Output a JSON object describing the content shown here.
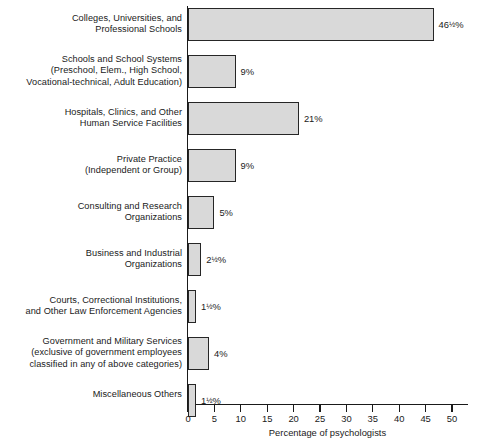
{
  "chart_data": {
    "type": "bar",
    "orientation": "horizontal",
    "title": "",
    "xlabel": "Percentage of psychologists",
    "ylabel": "",
    "xlim": [
      0,
      50
    ],
    "xticks": [
      0,
      5,
      10,
      15,
      20,
      25,
      30,
      35,
      40,
      45,
      50
    ],
    "xtick_labels": [
      "0",
      "5",
      "10",
      "15",
      "20",
      "25",
      "30",
      "35",
      "40",
      "45",
      "50"
    ],
    "grid": false,
    "legend": null,
    "bar_fill_color": "#d9d9d9",
    "bar_edge_color": "#262626",
    "categories": [
      "Colleges, Universities, and\nProfessional Schools",
      "Schools and School Systems\n(Preschool, Elem., High School,\nVocational-technical, Adult Education)",
      "Hospitals, Clinics, and Other\nHuman Service Facilities",
      "Private Practice\n(Independent or Group)",
      "Consulting and Research\nOrganizations",
      "Business and Industrial\nOrganizations",
      "Courts, Correctional Institutions,\nand Other Law Enforcement Agencies",
      "Government and Military Services\n(exclusive of government employees\nclassified in any of above categories)",
      "Miscellaneous Others"
    ],
    "values": [
      46.5,
      9,
      21,
      9,
      5,
      2.5,
      1.5,
      4,
      1.5
    ],
    "value_labels": [
      "46½%",
      "9%",
      "21%",
      "9%",
      "5%",
      "2½%",
      "1½%",
      "4%",
      "1½%"
    ],
    "bars": [
      {
        "category": "Colleges, Universities, and Professional Schools",
        "value": 46.5,
        "label": "46½%"
      },
      {
        "category": "Schools and School Systems (Preschool, Elem., High School, Vocational-technical, Adult Education)",
        "value": 9,
        "label": "9%"
      },
      {
        "category": "Hospitals, Clinics, and Other Human Service Facilities",
        "value": 21,
        "label": "21%"
      },
      {
        "category": "Private Practice (Independent or Group)",
        "value": 9,
        "label": "9%"
      },
      {
        "category": "Consulting and Research Organizations",
        "value": 5,
        "label": "5%"
      },
      {
        "category": "Business and Industrial Organizations",
        "value": 2.5,
        "label": "2½%"
      },
      {
        "category": "Courts, Correctional Institutions, and Other Law Enforcement Agencies",
        "value": 1.5,
        "label": "1½%"
      },
      {
        "category": "Government and Military Services (exclusive of government employees classified in any of above categories)",
        "value": 4,
        "label": "4%"
      },
      {
        "category": "Miscellaneous Others",
        "value": 1.5,
        "label": "1½%"
      }
    ]
  }
}
